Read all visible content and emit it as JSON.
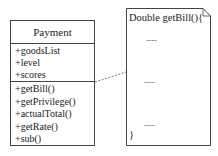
{
  "class_box": {
    "name": "Payment",
    "attributes": [
      "+goodsList",
      "+level",
      "+scores"
    ],
    "operations": [
      "+getBill()",
      "+getPrivilege()",
      "+actualTotal()",
      "+getRate()",
      "+sub()"
    ]
  },
  "note": {
    "header": "Double getBill(){",
    "ellipses": [
      "......",
      "......",
      "......"
    ],
    "closing": "}"
  },
  "connector": {
    "style": "dashed"
  }
}
